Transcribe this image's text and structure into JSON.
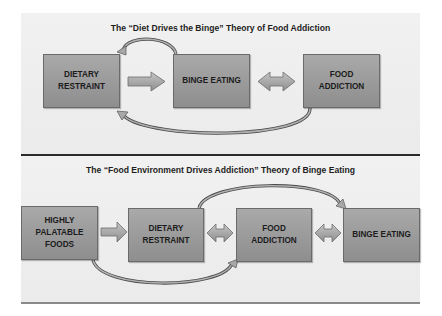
{
  "top_diagram": {
    "title": "The “Diet Drives the Binge” Theory of Food Addiction",
    "boxes": [
      {
        "label": "DIETARY\nRESTRAINT"
      },
      {
        "label": "BINGE EATING"
      },
      {
        "label": "FOOD\nADDICTION"
      }
    ],
    "connectors": [
      {
        "from": "DIETARY RESTRAINT",
        "to": "BINGE EATING",
        "type": "arrow-right"
      },
      {
        "from": "BINGE EATING",
        "to": "FOOD ADDICTION",
        "type": "double-arrow"
      },
      {
        "from": "BINGE EATING",
        "to": "DIETARY RESTRAINT",
        "type": "curved-arrow-top"
      },
      {
        "from": "FOOD ADDICTION",
        "to": "DIETARY RESTRAINT",
        "type": "curved-arrow-bottom"
      }
    ]
  },
  "bottom_diagram": {
    "title": "The “Food Environment Drives Addiction” Theory of Binge Eating",
    "boxes": [
      {
        "label": "HIGHLY\nPALATABLE\nFOODS"
      },
      {
        "label": "DIETARY\nRESTRAINT"
      },
      {
        "label": "FOOD\nADDICTION"
      },
      {
        "label": "BINGE EATING"
      }
    ],
    "connectors": [
      {
        "from": "HIGHLY PALATABLE FOODS",
        "to": "DIETARY RESTRAINT",
        "type": "arrow-right"
      },
      {
        "from": "DIETARY RESTRAINT",
        "to": "FOOD ADDICTION",
        "type": "double-arrow"
      },
      {
        "from": "FOOD ADDICTION",
        "to": "BINGE EATING",
        "type": "double-arrow"
      },
      {
        "from": "DIETARY RESTRAINT",
        "to": "BINGE EATING",
        "type": "curved-arrow-top"
      },
      {
        "from": "HIGHLY PALATABLE FOODS",
        "to": "FOOD ADDICTION",
        "type": "curved-arrow-bottom"
      }
    ]
  },
  "colors": {
    "panel_bg": "#efefef",
    "box_fill_top": "#a9a9a9",
    "box_fill_bottom": "#8e8e8e",
    "arrow_fill": "#a8a8a8",
    "divider": "#2a2a2a"
  }
}
